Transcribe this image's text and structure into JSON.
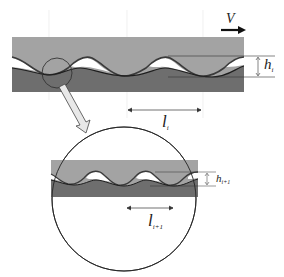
{
  "diagram": {
    "type": "surface-roughness-scale-diagram",
    "colors": {
      "upper_body": "#a3a3a3",
      "lower_body": "#6e6e6e",
      "gap": "#ffffff",
      "outline": "#2a2a2a",
      "arrow_fill": "#e8e8e8"
    },
    "top_view": {
      "velocity_label": "V",
      "height_label": "h",
      "height_subscript": "i",
      "wavelength_label": "l",
      "wavelength_subscript": "i"
    },
    "zoom_view": {
      "height_label": "h",
      "height_subscript": "i+1",
      "wavelength_label": "l",
      "wavelength_subscript": "i+1"
    }
  }
}
